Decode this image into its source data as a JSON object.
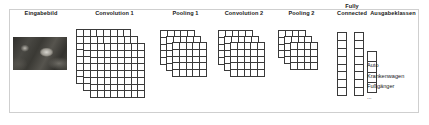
{
  "figure": {
    "title_implicit": "Convolutional Neural Network Architektur",
    "border_color": "#cfcfcf",
    "background": "#ffffff",
    "ink_color": "#3a3a3a",
    "text_color": "#1a1a1a"
  },
  "stages": [
    {
      "id": "input",
      "label": "Eingabebild",
      "kind": "image",
      "planes": 1,
      "grid": null
    },
    {
      "id": "conv1",
      "label": "Convolution 1",
      "kind": "feature-map-stack",
      "planes": 3,
      "grid": {
        "cols": 8,
        "rows": 8
      }
    },
    {
      "id": "pool1",
      "label": "Pooling 1",
      "kind": "feature-map-stack",
      "planes": 3,
      "grid": {
        "cols": 5,
        "rows": 5
      }
    },
    {
      "id": "conv2",
      "label": "Convolution 2",
      "kind": "feature-map-stack",
      "planes": 3,
      "grid": {
        "cols": 5,
        "rows": 5
      }
    },
    {
      "id": "pool2",
      "label": "Pooling 2",
      "kind": "feature-map-stack",
      "planes": 3,
      "grid": {
        "cols": 4,
        "rows": 4
      }
    },
    {
      "id": "fully-connected",
      "label": "Fully\nConnected",
      "kind": "vector-pair",
      "planes": 2,
      "grid": {
        "cols": 1,
        "rows": 8
      }
    },
    {
      "id": "output",
      "label": "Ausgabeklassen",
      "kind": "vector-with-legend",
      "planes": 1,
      "grid": {
        "cols": 1,
        "rows": 4
      }
    }
  ],
  "output_classes": [
    "Auto",
    "Krankenwagen",
    "Fußgänger",
    "..."
  ]
}
